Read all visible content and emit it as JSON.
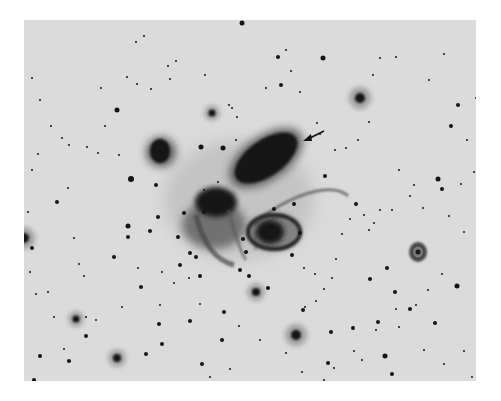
{
  "image": {
    "subject": "Compact galaxy group with interacting galaxies (photographic negative)",
    "rendering": "negative",
    "background_color": "#dcdcdc",
    "object_color": "#141414",
    "frame_color": "#ffffff"
  },
  "objects": {
    "galaxies": [
      {
        "name": "elongated-elliptical-galaxy",
        "description": "large elongated galaxy, upper center, indicated by arrow"
      },
      {
        "name": "left-compact-galaxy",
        "description": "round galaxy, upper left"
      },
      {
        "name": "disturbed-galaxy-center",
        "description": "irregular interacting galaxy, center left"
      },
      {
        "name": "spiral-galaxy-center",
        "description": "spiral galaxy with ring-like arm, center"
      },
      {
        "name": "small-spiral-galaxy-right",
        "description": "small face-on spiral galaxy, right"
      }
    ],
    "features": [
      {
        "name": "tidal-tail",
        "description": "curved faint tail extending to the right from the central group"
      },
      {
        "name": "pointer-arrow",
        "description": "arrow pointing at the edge of the elongated galaxy"
      }
    ],
    "star_field": "dense foreground stars across the field"
  }
}
